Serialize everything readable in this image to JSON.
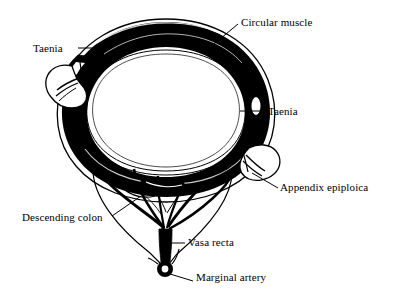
{
  "figure": {
    "background_color": "#ffffff",
    "ink_color": "#000000",
    "width": 394,
    "height": 302
  },
  "labels": {
    "circular_muscle": "Circular muscle",
    "taenia_left": "Taenia",
    "taenia_right": "Taenia",
    "appendix_epiploica": "Appendix epiploica",
    "descending_colon": "Descending colon",
    "vasa_recta": "Vasa recta",
    "marginal_artery": "Marginal artery"
  },
  "structures": [
    {
      "name": "circular-muscle",
      "label": "Circular muscle",
      "description": "Thick black muscular ring forming the colonic wall"
    },
    {
      "name": "taenia-left",
      "label": "Taenia",
      "description": "Longitudinal muscle band at the upper-left of the wall"
    },
    {
      "name": "taenia-right",
      "label": "Taenia",
      "description": "Longitudinal muscle band at the right of the wall"
    },
    {
      "name": "taenia-inferior",
      "label": "Taenia",
      "description": "Longitudinal muscle band at the mesenteric border"
    },
    {
      "name": "appendix-epiploica-left",
      "label": "Appendix epiploica",
      "description": "Fatty lobe projecting from the upper-left wall"
    },
    {
      "name": "appendix-epiploica-right",
      "label": "Appendix epiploica",
      "description": "Fatty lobe projecting from the lower-right wall"
    },
    {
      "name": "lumen",
      "label": "Lumen",
      "description": "Central white cavity lined by mucosa"
    },
    {
      "name": "mesentery",
      "label": "Mesentery",
      "description": "Triangular fold suspending the bowel below"
    },
    {
      "name": "vasa-recta",
      "label": "Vasa recta",
      "description": "Straight vessels branching toward the bowel wall"
    },
    {
      "name": "marginal-artery",
      "label": "Marginal artery",
      "description": "Artery shown in cross-section at the mesenteric apex"
    }
  ]
}
